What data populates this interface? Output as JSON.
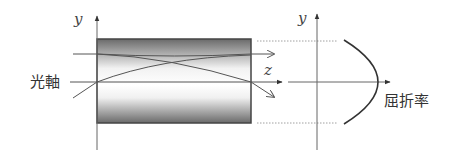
{
  "diagram": {
    "left_panel": {
      "y_axis_label": "y",
      "z_axis_label": "z",
      "optical_axis_label": "光軸"
    },
    "right_panel": {
      "y_axis_label": "y",
      "x_axis_label": "屈折率"
    },
    "colors": {
      "line": "#555555",
      "gradient_edge": "#6a6a6a",
      "gradient_center": "#ffffff"
    }
  }
}
